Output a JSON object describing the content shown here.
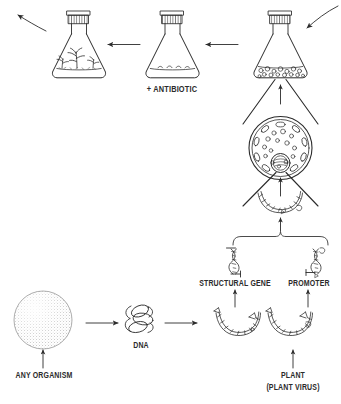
{
  "figure": {
    "style": "hand-drawn line illustration, black ink on white",
    "ink_color": "#2b2b2b",
    "background_color": "#ffffff"
  },
  "labels": {
    "antibiotic": "+ ANTIBIOTIC",
    "structural_gene": "STRUCTURAL GENE",
    "promoter": "PROMOTER",
    "plant": "PLANT",
    "plant_virus": "(PLANT VIRUS)",
    "dna": "DNA",
    "any_organism": "ANY ORGANISM"
  },
  "nodes": [
    {
      "id": "flask-plantlets",
      "name": "flask-with-plantlets",
      "content": "regenerated plantlets growing in flask"
    },
    {
      "id": "flask-selection",
      "name": "flask-antibiotic-selection",
      "content": "flask with culture medium and selected colonies"
    },
    {
      "id": "flask-cells",
      "name": "flask-transformed-cells",
      "content": "flask with transformed plant cells in suspension"
    },
    {
      "id": "plant-cell",
      "name": "plant-cell-protoplast",
      "content": "plant cell showing nucleus, chloroplasts and vacuoles"
    },
    {
      "id": "dna-construct",
      "name": "recombinant-dna-construct",
      "content": "recombinant circular DNA construct"
    },
    {
      "id": "structural-gene-dna",
      "name": "structural-gene-fragment",
      "content": "linear DNA helix fragment"
    },
    {
      "id": "promoter-dna",
      "name": "promoter-fragment",
      "content": "linear DNA helix fragment"
    },
    {
      "id": "source-plasmid-left",
      "name": "source-dna-circle-left",
      "content": "circular source DNA from any organism"
    },
    {
      "id": "source-plasmid-right",
      "name": "source-dna-circle-right",
      "content": "circular source DNA from plant or plant virus"
    },
    {
      "id": "dna-coil",
      "name": "dna-coil",
      "content": "tangled DNA coil"
    },
    {
      "id": "organism-sphere",
      "name": "any-organism-sphere",
      "content": "stippled sphere representing any organism"
    }
  ],
  "arrows": [
    {
      "name": "arrow-out-top-left",
      "direction": "curved up-left",
      "meaning": "process continues off-figure"
    },
    {
      "name": "arrow-in-top-right",
      "direction": "curved down-left",
      "meaning": "process enters figure"
    },
    {
      "name": "arrow-selection-to-plantlets",
      "direction": "left"
    },
    {
      "name": "arrow-cells-to-selection",
      "direction": "left"
    },
    {
      "name": "arrow-cell-to-flask",
      "direction": "up"
    },
    {
      "name": "arrow-construct-to-cell",
      "direction": "up"
    },
    {
      "name": "arrow-bracket-to-construct",
      "direction": "up"
    },
    {
      "name": "arrow-source-to-structural-gene",
      "direction": "up"
    },
    {
      "name": "arrow-source-to-promoter",
      "direction": "up"
    },
    {
      "name": "arrow-plant-to-source",
      "direction": "up"
    },
    {
      "name": "arrow-organism-to-sphere",
      "direction": "up"
    },
    {
      "name": "arrow-sphere-to-dna",
      "direction": "right"
    },
    {
      "name": "arrow-dna-to-constructs",
      "direction": "right"
    }
  ]
}
